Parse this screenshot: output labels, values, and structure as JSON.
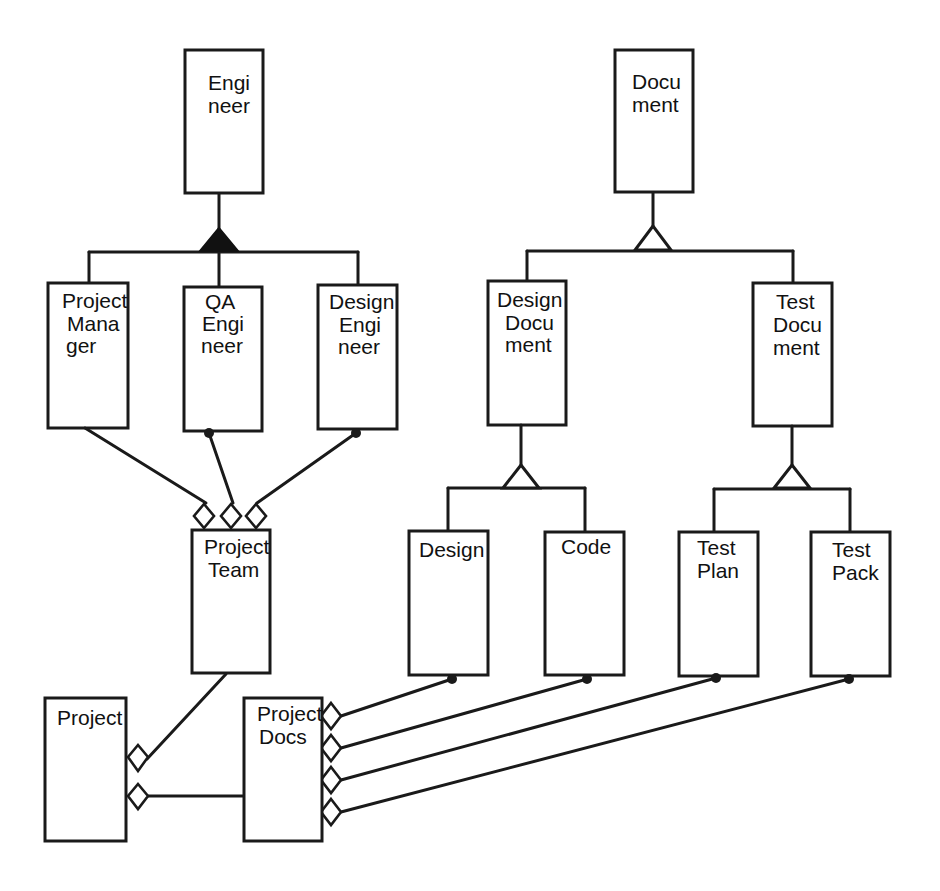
{
  "diagram": {
    "title": "",
    "colors": {
      "stroke": "#1a1a1a",
      "background": "#ffffff",
      "text": "#111111"
    },
    "classes": {
      "engineer": {
        "lines": [
          "Engi",
          "neer"
        ]
      },
      "project_manager": {
        "lines": [
          "Project",
          "Mana",
          "ger"
        ]
      },
      "qa_engineer": {
        "lines": [
          "QA",
          "Engi",
          "neer"
        ]
      },
      "design_engineer": {
        "lines": [
          "Design",
          "Engi",
          "neer"
        ]
      },
      "document": {
        "lines": [
          "Docu",
          "ment"
        ]
      },
      "design_document": {
        "lines": [
          "Design",
          "Docu",
          "ment"
        ]
      },
      "test_document": {
        "lines": [
          "Test",
          "Docu",
          "ment"
        ]
      },
      "design": {
        "lines": [
          "Design"
        ]
      },
      "code": {
        "lines": [
          "Code"
        ]
      },
      "test_plan": {
        "lines": [
          "Test",
          "Plan"
        ]
      },
      "test_pack": {
        "lines": [
          "Test",
          "Pack"
        ]
      },
      "project_team": {
        "lines": [
          "Project",
          "Team"
        ]
      },
      "project": {
        "lines": [
          "Project"
        ]
      },
      "project_docs": {
        "lines": [
          "Project",
          "Docs"
        ]
      }
    },
    "relationships": [
      {
        "type": "generalization-exclusive",
        "marker": "filled-triangle",
        "parent": "Engineer",
        "children": [
          "Project Manager",
          "QA Engineer",
          "Design Engineer"
        ]
      },
      {
        "type": "generalization",
        "marker": "open-triangle",
        "parent": "Document",
        "children": [
          "Design Document",
          "Test Document"
        ]
      },
      {
        "type": "generalization",
        "marker": "open-triangle",
        "parent": "Design Document",
        "children": [
          "Design",
          "Code"
        ]
      },
      {
        "type": "generalization",
        "marker": "open-triangle",
        "parent": "Test Document",
        "children": [
          "Test Plan",
          "Test Pack"
        ]
      },
      {
        "type": "aggregation",
        "whole": "Project Team",
        "part": "Project Manager",
        "part_end": "single"
      },
      {
        "type": "aggregation",
        "whole": "Project Team",
        "part": "QA Engineer",
        "part_end": "many"
      },
      {
        "type": "aggregation",
        "whole": "Project Team",
        "part": "Design Engineer",
        "part_end": "many"
      },
      {
        "type": "aggregation",
        "whole": "Project",
        "part": "Project Team",
        "part_end": "single"
      },
      {
        "type": "aggregation",
        "whole": "Project",
        "part": "Project Docs",
        "part_end": "single"
      },
      {
        "type": "aggregation",
        "whole": "Project Docs",
        "part": "Design",
        "part_end": "many"
      },
      {
        "type": "aggregation",
        "whole": "Project Docs",
        "part": "Code",
        "part_end": "many"
      },
      {
        "type": "aggregation",
        "whole": "Project Docs",
        "part": "Test Plan",
        "part_end": "many"
      },
      {
        "type": "aggregation",
        "whole": "Project Docs",
        "part": "Test Pack",
        "part_end": "many"
      }
    ]
  }
}
